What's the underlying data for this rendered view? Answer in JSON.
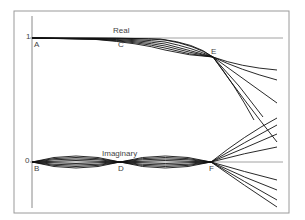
{
  "figure": {
    "axis_ticks": {
      "one": "1",
      "zero": "0"
    },
    "series_labels": {
      "real": "Real",
      "imaginary": "Imaginary"
    },
    "points": {
      "A": "A",
      "B": "B",
      "C": "C",
      "D": "D",
      "E": "E",
      "F": "F"
    },
    "colors": {
      "frame": "#888888",
      "curves": "#111111",
      "axis": "#777777"
    }
  }
}
